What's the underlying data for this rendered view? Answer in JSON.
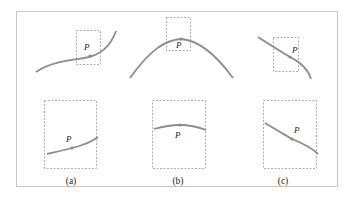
{
  "figure": {
    "point_label": "P",
    "panels": [
      {
        "id": "a",
        "caption": "(a)"
      },
      {
        "id": "b",
        "caption": "(b)"
      },
      {
        "id": "c",
        "caption": "(c)"
      }
    ],
    "colors": {
      "curve": "#8c8c8c",
      "box": "#9a9a9a",
      "frame": "#c8c8c8",
      "point": "#8a8a8a",
      "text": "#222222"
    }
  }
}
